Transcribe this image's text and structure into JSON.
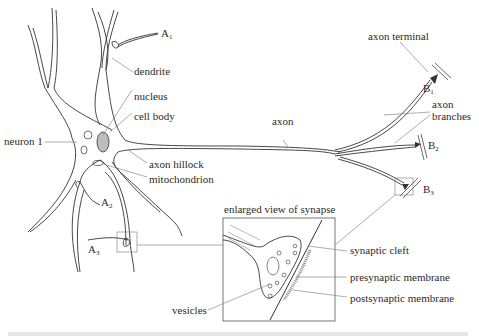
{
  "diagram": {
    "type": "neuron anatomy diagram",
    "labels": {
      "a1": "A",
      "a1_sub": "1",
      "a2": "A",
      "a2_sub": "2",
      "a3": "A",
      "a3_sub": "3",
      "b1": "B",
      "b1_sub": "1",
      "b2": "B",
      "b2_sub": "2",
      "b3": "B",
      "b3_sub": "3",
      "dendrite": "dendrite",
      "nucleus": "nucleus",
      "cell_body": "cell body",
      "neuron": "neuron 1",
      "axon_hillock": "axon hillock",
      "mitochondrion": "mitochondrion",
      "axon": "axon",
      "axon_terminal": "axon terminal",
      "axon_branches_1": "axon",
      "axon_branches_2": "branches",
      "inset_title": "enlarged view of synapse",
      "synaptic_cleft": "synaptic cleft",
      "presynaptic": "presynaptic membrane",
      "postsynaptic": "postsynaptic membrane",
      "vesicles": "vesicles"
    },
    "colors": {
      "line": "#444444",
      "text": "#2a2a2a",
      "background": "#ffffff"
    }
  }
}
